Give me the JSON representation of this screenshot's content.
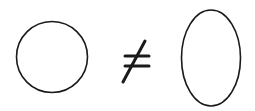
{
  "diagram": {
    "shapes": [
      {
        "type": "circle",
        "cx": 52,
        "cy": 57,
        "r": 36
      },
      {
        "type": "not-equal-sign",
        "symbol": "≠"
      },
      {
        "type": "ellipse",
        "cx": 211,
        "cy": 58,
        "rx": 30,
        "ry": 48
      }
    ],
    "stroke_color": "#1a1a1a",
    "background": "#ffffff"
  }
}
